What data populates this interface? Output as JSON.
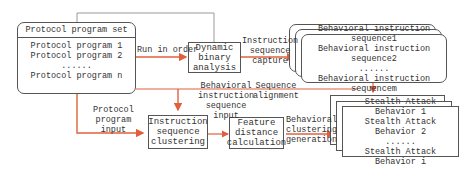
{
  "protocol_set": {
    "title": "Protocol program set",
    "items": [
      "Protocol program 1",
      "Protocol program 2",
      "......",
      "Protocol program n"
    ]
  },
  "nodes": {
    "dynamic_binary_analysis": [
      "Dynamic",
      "binary",
      "analysis"
    ],
    "instruction_sequence_clustering": [
      "Instruction",
      "sequence",
      "clustering"
    ],
    "feature_distance_calculation": [
      "Feature",
      "distance",
      "calculation"
    ]
  },
  "behavioral_sequences": {
    "items": [
      "Behavioral instruction sequence1",
      "Behavioral instruction sequence2",
      "......",
      "Behavioral instruction sequencem"
    ]
  },
  "stealth_behaviors": {
    "items": [
      "Stealth Attack Behavior 1",
      "Stealth Attack Behavior 2",
      "......",
      "Stealth Attack Behavior i"
    ]
  },
  "edge_labels": {
    "run_in_order": "Run in order",
    "instruction_sequence_capture": [
      "Instruction",
      "sequence",
      "capture"
    ],
    "behavioral_instruction_sequence_input": [
      "Behavioral",
      "instruction",
      "sequence",
      "input"
    ],
    "sequence_alignment": [
      "Sequence",
      "alignment"
    ],
    "protocol_program_input": [
      "Protocol",
      "program",
      "input"
    ],
    "behavioral_clustering_generation": [
      "Behavioral",
      "clustering",
      "generation"
    ]
  },
  "colors": {
    "arrow": "#e0603c",
    "gray_line": "#888888",
    "border": "#555555"
  }
}
